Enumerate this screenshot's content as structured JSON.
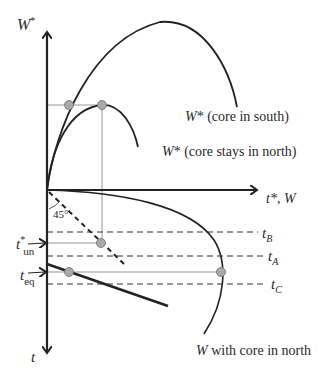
{
  "diagram": {
    "axes": {
      "vertical_top_label": "W*",
      "horizontal_label": "t*, W",
      "vertical_bottom_label": "t"
    },
    "curves": {
      "core_in_south": "W* (core in south)",
      "core_stays_in_north": "W* (core stays in north)",
      "w_core_in_north": "W with core in north"
    },
    "angle_label": "45°",
    "levels": {
      "t_B": "t_B",
      "t_A": "t_A",
      "t_C": "t_C",
      "t_un": "t*_un",
      "t_eq": "t_eq"
    },
    "text_parts": {
      "W_star_italic": "W",
      "star": "*",
      "core_in_south_rest": " (core in south)",
      "core_stays_rest": " (core stays in north)",
      "t_star_w": "t*, W",
      "W_italic": "W",
      "w_core_north_rest": " with core in north",
      "t": "t",
      "t_base": "t",
      "sub_B": "B",
      "sub_A": "A",
      "sub_C": "C",
      "sub_un": "un",
      "sub_eq": "eq",
      "deg45": "45°"
    },
    "colors": {
      "line": "#222222",
      "guide": "#888888",
      "point_fill": "#a9a9a9",
      "point_stroke": "#6e6e6e"
    }
  }
}
